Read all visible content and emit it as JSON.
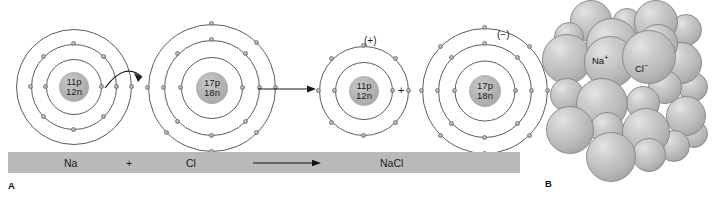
{
  "figure": {
    "panel_a_letter": "A",
    "panel_b_letter": "B"
  },
  "panel_a": {
    "reactants": {
      "sodium_atom": {
        "nucleus_protons": "11p",
        "nucleus_neutrons": "12n",
        "shell_electron_counts": [
          2,
          8,
          1
        ]
      },
      "chlorine_atom": {
        "nucleus_protons": "17p",
        "nucleus_neutrons": "18n",
        "shell_electron_counts": [
          2,
          8,
          7
        ]
      },
      "electron_transfer_arrow": "curved-arrow-na-to-cl"
    },
    "reaction_arrow": "straight-right-arrow",
    "products": {
      "sodium_ion": {
        "nucleus_protons": "11p",
        "nucleus_neutrons": "12n",
        "charge": "(+)",
        "shell_electron_counts": [
          2,
          8
        ]
      },
      "chloride_ion": {
        "nucleus_protons": "17p",
        "nucleus_neutrons": "18n",
        "charge": "(−)",
        "shell_electron_counts": [
          2,
          8,
          8
        ]
      },
      "join_symbol": "+"
    },
    "equation_bar": {
      "reactant_1": "Na",
      "operator": "+",
      "reactant_2": "Cl",
      "arrow": "yields-arrow",
      "product": "NaCl",
      "bar_color": "#b9b9b9"
    }
  },
  "panel_b": {
    "title_ions": {
      "sodium_ion_label": "Na",
      "sodium_ion_charge": "+",
      "chloride_ion_label": "Cl",
      "chloride_ion_charge": "−"
    },
    "structure": "nacl-crystal-lattice"
  }
}
